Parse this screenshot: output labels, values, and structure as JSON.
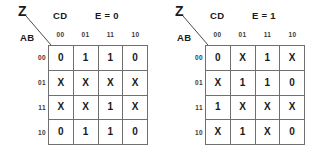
{
  "diagram": {
    "type": "karnaugh-map-pair",
    "output_variable": "Z",
    "column_variables": "CD",
    "row_variables": "AB",
    "column_headers": [
      "00",
      "01",
      "11",
      "10"
    ],
    "row_headers": [
      "00",
      "01",
      "11",
      "10"
    ],
    "maps": [
      {
        "condition": "E = 0",
        "output_variable": "Z",
        "column_variables": "CD",
        "row_variables": "AB",
        "cells": [
          [
            "0",
            "1",
            "1",
            "0"
          ],
          [
            "X",
            "X",
            "X",
            "X"
          ],
          [
            "X",
            "X",
            "1",
            "X"
          ],
          [
            "0",
            "1",
            "1",
            "0"
          ]
        ]
      },
      {
        "condition": "E = 1",
        "output_variable": "Z",
        "column_variables": "CD",
        "row_variables": "AB",
        "cells": [
          [
            "0",
            "X",
            "1",
            "X"
          ],
          [
            "X",
            "1",
            "1",
            "0"
          ],
          [
            "1",
            "X",
            "X",
            "X"
          ],
          [
            "X",
            "1",
            "X",
            "0"
          ]
        ]
      }
    ]
  },
  "colors": {
    "background": "#ffffff",
    "grid_line": "#6f6f6f",
    "text": "#1a1a1a",
    "header_text": "#3a3a3a",
    "slash_line": "#4a4a4a"
  }
}
